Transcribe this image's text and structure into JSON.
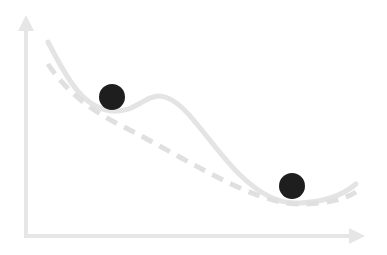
{
  "diagram": {
    "type": "loss-landscape",
    "colors": {
      "axis": "#e6e6e6",
      "solid_curve": "#e4e4e4",
      "dashed_curve": "#e0e0e0",
      "ball": "#1e1e1e",
      "background": "#ffffff"
    },
    "axes": {
      "y_axis": {
        "x": 26,
        "y_top": 15,
        "y_bottom": 236
      },
      "x_axis": {
        "y": 236,
        "x_left": 26,
        "x_right": 365
      }
    },
    "curves": [
      {
        "name": "solid-curve",
        "style": "solid",
        "path": "M48,42 C70,85 85,108 112,111 C135,113 145,95 160,96 C185,98 205,140 240,175 C262,196 280,204 300,203 C325,202 342,196 356,184"
      },
      {
        "name": "dashed-curve",
        "style": "dashed",
        "path": "M48,64 C65,90 90,110 120,125 C160,145 200,170 240,188 C265,199 285,205 305,204 C330,203 345,199 356,192"
      }
    ],
    "balls": [
      {
        "name": "local-minimum-ball",
        "cx": 112,
        "cy": 97,
        "r": 13
      },
      {
        "name": "global-minimum-ball",
        "cx": 292,
        "cy": 186,
        "r": 13
      }
    ]
  }
}
